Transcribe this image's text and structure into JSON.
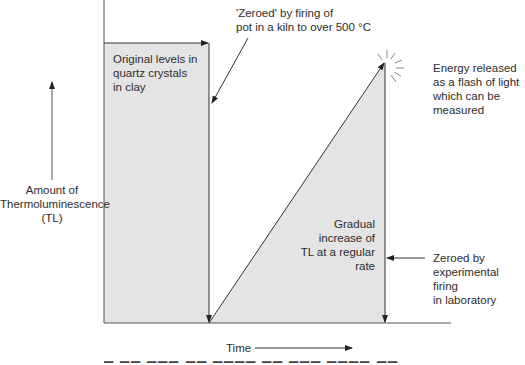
{
  "diagram": {
    "y_axis_label": [
      "Amount of",
      "Thermoluminescence",
      "(TL)"
    ],
    "x_axis_label": "Time",
    "annotations": {
      "original_levels": [
        "Original levels in",
        "quartz crystals",
        "in clay"
      ],
      "zeroed_kiln": [
        "'Zeroed' by firing of",
        "pot in a kiln to over 500 °C"
      ],
      "energy_released": [
        "Energy released",
        "as a flash of light",
        "which can be",
        "measured"
      ],
      "gradual_increase": [
        "Gradual",
        "increase of",
        "TL at a regular",
        "rate"
      ],
      "zeroed_lab": [
        "Zeroed by",
        "experimental firing",
        "in laboratory"
      ]
    },
    "caption_partial": "The ... (caption cut off at bottom edge)",
    "colors": {
      "fill": "#e4e4e4",
      "line": "#3a3a3a",
      "text": "#2d2d2d"
    }
  }
}
